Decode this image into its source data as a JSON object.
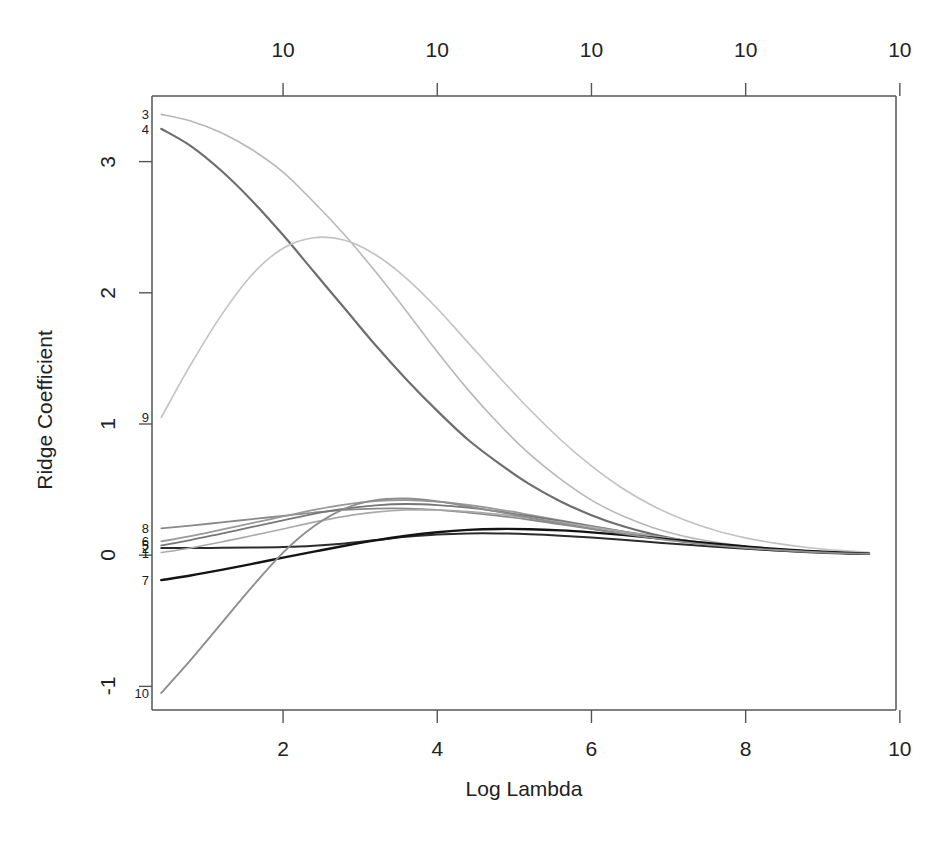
{
  "chart_data": {
    "type": "line",
    "title": "",
    "xlabel": "Log Lambda",
    "ylabel": "Ridge Coefficient",
    "xlim": [
      0.3,
      9.95
    ],
    "ylim": [
      -1.18,
      3.5
    ],
    "grid": false,
    "legend_position": "inline-left-labels",
    "top_axis": {
      "label_text": "10",
      "ticks": [
        {
          "x": 2,
          "label": "10"
        },
        {
          "x": 4,
          "label": "10"
        },
        {
          "x": 6,
          "label": "10"
        },
        {
          "x": 8,
          "label": "10"
        },
        {
          "x": 10,
          "label": "10"
        }
      ]
    },
    "bottom_axis": {
      "ticks": [
        {
          "x": 2,
          "label": "2"
        },
        {
          "x": 4,
          "label": "4"
        },
        {
          "x": 6,
          "label": "6"
        },
        {
          "x": 8,
          "label": "8"
        },
        {
          "x": 10,
          "label": "10"
        }
      ]
    },
    "left_axis": {
      "ticks": [
        {
          "y": 3,
          "label": "3"
        },
        {
          "y": 2,
          "label": "2"
        },
        {
          "y": 1,
          "label": "1"
        },
        {
          "y": 0,
          "label": "0"
        },
        {
          "y": -1,
          "label": "-1"
        }
      ]
    },
    "x": [
      0.42,
      0.8,
      1.2,
      1.6,
      2.0,
      2.4,
      2.8,
      3.2,
      3.6,
      4.0,
      4.4,
      4.8,
      5.2,
      5.6,
      6.0,
      6.4,
      6.8,
      7.2,
      7.6,
      8.0,
      8.4,
      8.8,
      9.2,
      9.6
    ],
    "series": [
      {
        "name": "3",
        "label": "3",
        "color": "#b8b8b8",
        "width": 1.6,
        "start_value": 3.36,
        "values": [
          3.36,
          3.31,
          3.22,
          3.09,
          2.92,
          2.69,
          2.44,
          2.16,
          1.86,
          1.55,
          1.26,
          1.0,
          0.77,
          0.58,
          0.42,
          0.3,
          0.21,
          0.145,
          0.1,
          0.067,
          0.044,
          0.028,
          0.017,
          0.01
        ]
      },
      {
        "name": "4",
        "label": "4",
        "color": "#6e6e6e",
        "width": 2.2,
        "start_value": 3.25,
        "values": [
          3.25,
          3.12,
          2.93,
          2.7,
          2.44,
          2.16,
          1.88,
          1.6,
          1.34,
          1.1,
          0.88,
          0.7,
          0.54,
          0.41,
          0.305,
          0.222,
          0.159,
          0.112,
          0.078,
          0.053,
          0.036,
          0.023,
          0.014,
          0.009
        ]
      },
      {
        "name": "9",
        "label": "9",
        "color": "#c2c2c2",
        "width": 1.6,
        "start_value": 1.05,
        "values": [
          1.05,
          1.45,
          1.83,
          2.14,
          2.34,
          2.42,
          2.4,
          2.29,
          2.11,
          1.88,
          1.62,
          1.36,
          1.11,
          0.88,
          0.68,
          0.51,
          0.375,
          0.27,
          0.19,
          0.132,
          0.09,
          0.059,
          0.037,
          0.022
        ]
      },
      {
        "name": "8",
        "label": "8",
        "color": "#8a8a8a",
        "width": 1.8,
        "start_value": 0.205,
        "values": [
          0.205,
          0.225,
          0.25,
          0.275,
          0.3,
          0.325,
          0.345,
          0.355,
          0.355,
          0.345,
          0.325,
          0.3,
          0.27,
          0.235,
          0.2,
          0.165,
          0.132,
          0.103,
          0.078,
          0.058,
          0.042,
          0.029,
          0.019,
          0.012
        ]
      },
      {
        "name": "6",
        "label": "6",
        "color": "#9a9a9a",
        "width": 1.8,
        "start_value": 0.105,
        "values": [
          0.105,
          0.145,
          0.195,
          0.245,
          0.295,
          0.345,
          0.385,
          0.412,
          0.42,
          0.408,
          0.383,
          0.348,
          0.308,
          0.266,
          0.223,
          0.182,
          0.144,
          0.111,
          0.083,
          0.061,
          0.043,
          0.029,
          0.018,
          0.011
        ]
      },
      {
        "name": "5",
        "label": "5",
        "color": "#777777",
        "width": 1.8,
        "start_value": 0.075,
        "values": [
          0.075,
          0.115,
          0.165,
          0.215,
          0.265,
          0.315,
          0.355,
          0.38,
          0.39,
          0.382,
          0.362,
          0.333,
          0.298,
          0.26,
          0.22,
          0.181,
          0.145,
          0.113,
          0.085,
          0.062,
          0.044,
          0.03,
          0.019,
          0.011
        ]
      },
      {
        "name": "2",
        "label": "2",
        "color": "#2c2c2c",
        "width": 2.0,
        "start_value": 0.055,
        "values": [
          0.055,
          0.055,
          0.056,
          0.058,
          0.062,
          0.072,
          0.09,
          0.115,
          0.14,
          0.158,
          0.166,
          0.166,
          0.16,
          0.149,
          0.134,
          0.117,
          0.099,
          0.081,
          0.064,
          0.049,
          0.036,
          0.025,
          0.016,
          0.01
        ]
      },
      {
        "name": "1",
        "label": "1",
        "color": "#aaaaaa",
        "width": 1.6,
        "start_value": 0.02,
        "values": [
          0.02,
          0.055,
          0.1,
          0.15,
          0.2,
          0.252,
          0.296,
          0.328,
          0.344,
          0.344,
          0.332,
          0.311,
          0.283,
          0.251,
          0.216,
          0.18,
          0.146,
          0.115,
          0.088,
          0.065,
          0.047,
          0.032,
          0.02,
          0.012
        ]
      },
      {
        "name": "7",
        "label": "7",
        "color": "#141414",
        "width": 2.4,
        "start_value": -0.19,
        "values": [
          -0.19,
          -0.155,
          -0.112,
          -0.066,
          -0.019,
          0.027,
          0.072,
          0.113,
          0.148,
          0.175,
          0.193,
          0.2,
          0.198,
          0.189,
          0.174,
          0.155,
          0.133,
          0.11,
          0.087,
          0.066,
          0.047,
          0.032,
          0.02,
          0.012
        ]
      },
      {
        "name": "10",
        "label": "10",
        "color": "#8e8e8e",
        "width": 1.9,
        "start_value": -1.05,
        "values": [
          -1.05,
          -0.8,
          -0.52,
          -0.24,
          0.02,
          0.22,
          0.355,
          0.42,
          0.432,
          0.41,
          0.372,
          0.33,
          0.286,
          0.243,
          0.202,
          0.164,
          0.13,
          0.1,
          0.075,
          0.055,
          0.039,
          0.026,
          0.016,
          0.01
        ]
      }
    ],
    "series_labels_left": [
      {
        "name": "3",
        "value": 3.36
      },
      {
        "name": "4",
        "value": 3.25
      },
      {
        "name": "9",
        "value": 1.05
      },
      {
        "name": "8",
        "value": 0.205
      },
      {
        "name": "6",
        "value": 0.105
      },
      {
        "name": "5",
        "value": 0.075
      },
      {
        "name": "2",
        "value": 0.055
      },
      {
        "name": "1",
        "value": 0.02
      },
      {
        "name": "7",
        "value": -0.19
      },
      {
        "name": "10",
        "value": -1.05
      }
    ]
  },
  "figure": {
    "background_color": "#ffffff",
    "axis_color": "#555555",
    "text_color": "#222222"
  }
}
